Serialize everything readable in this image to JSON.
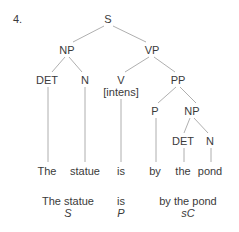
{
  "item_number": "4.",
  "tree": {
    "nodes": {
      "S": {
        "label": "S",
        "x": 108,
        "y": 13
      },
      "NP1": {
        "label": "NP",
        "x": 67,
        "y": 44
      },
      "VP": {
        "label": "VP",
        "x": 152,
        "y": 44
      },
      "DET1": {
        "label": "DET",
        "x": 47,
        "y": 74
      },
      "N1": {
        "label": "N",
        "x": 85,
        "y": 74
      },
      "V": {
        "label": "V",
        "x": 121,
        "y": 74
      },
      "V_feature": {
        "label": "[intens]",
        "x": 121,
        "y": 86
      },
      "PP": {
        "label": "PP",
        "x": 178,
        "y": 74
      },
      "P": {
        "label": "P",
        "x": 155,
        "y": 105
      },
      "NP2": {
        "label": "NP",
        "x": 192,
        "y": 105
      },
      "DET2": {
        "label": "DET",
        "x": 183,
        "y": 135
      },
      "N2": {
        "label": "N",
        "x": 210,
        "y": 135
      }
    },
    "words": [
      {
        "text": "The",
        "x": 47
      },
      {
        "text": "statue",
        "x": 85
      },
      {
        "text": "is",
        "x": 121
      },
      {
        "text": "by",
        "x": 155
      },
      {
        "text": "the",
        "x": 183
      },
      {
        "text": "pond",
        "x": 210
      }
    ],
    "functions": [
      {
        "phrase": "The statue",
        "role": "S",
        "x": 68
      },
      {
        "phrase": "is",
        "role": "P",
        "x": 121
      },
      {
        "phrase": "by the pond",
        "role": "sC",
        "x": 188
      }
    ]
  },
  "colors": {
    "text": "#3a3a3a",
    "branch": "#9a9a9a"
  }
}
